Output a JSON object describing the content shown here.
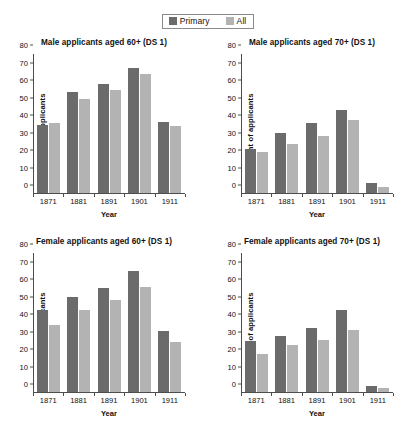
{
  "legend": {
    "items": [
      {
        "label": "Primary",
        "color": "#6b6b6b",
        "icon": "square-swatch-icon"
      },
      {
        "label": "All",
        "color": "#b3b3b3",
        "icon": "square-swatch-icon"
      }
    ]
  },
  "colors": {
    "primary": "#6b6b6b",
    "all": "#b3b3b3",
    "axis": "#4d4d4d",
    "text": "#111111",
    "background": "#ffffff"
  },
  "axis": {
    "yticks": [
      0,
      10,
      20,
      30,
      40,
      50,
      60,
      70,
      80
    ],
    "ylim": [
      0,
      80
    ],
    "ylabel": "Per cent of applicants",
    "xlabel": "Year",
    "categories": [
      "1871",
      "1881",
      "1891",
      "1901",
      "1911"
    ]
  },
  "chart_data": [
    {
      "type": "bar",
      "title": "Male applicants aged 60+ (DS 1)",
      "xlabel": "Year",
      "ylabel": "Per cent of applicants",
      "ylim": [
        0,
        80
      ],
      "yticks": [
        0,
        10,
        20,
        30,
        40,
        50,
        60,
        70,
        80
      ],
      "grid": false,
      "legend_position": "top-center-shared",
      "categories": [
        "1871",
        "1881",
        "1891",
        "1901",
        "1911"
      ],
      "series": [
        {
          "name": "Primary",
          "color": "#6b6b6b",
          "values": [
            39.0,
            58.0,
            62.5,
            71.5,
            40.5
          ]
        },
        {
          "name": "All",
          "color": "#b3b3b3",
          "values": [
            39.8,
            53.8,
            59.0,
            67.8,
            38.5
          ]
        }
      ]
    },
    {
      "type": "bar",
      "title": "Male applicants aged 70+ (DS 1)",
      "xlabel": "Year",
      "ylabel": "Per cent of applicants",
      "ylim": [
        0,
        80
      ],
      "yticks": [
        0,
        10,
        20,
        30,
        40,
        50,
        60,
        70,
        80
      ],
      "grid": false,
      "legend_position": "top-center-shared",
      "categories": [
        "1871",
        "1881",
        "1891",
        "1901",
        "1911"
      ],
      "series": [
        {
          "name": "Primary",
          "color": "#6b6b6b",
          "values": [
            25.0,
            34.5,
            39.8,
            47.5,
            5.5
          ]
        },
        {
          "name": "All",
          "color": "#b3b3b3",
          "values": [
            23.3,
            27.8,
            32.8,
            41.5,
            3.6
          ]
        }
      ]
    },
    {
      "type": "bar",
      "title": "Female applicants aged 60+ (DS 1)",
      "xlabel": "Year",
      "ylabel": "Per cent of applicants",
      "ylim": [
        0,
        80
      ],
      "yticks": [
        0,
        10,
        20,
        30,
        40,
        50,
        60,
        70,
        80
      ],
      "grid": false,
      "legend_position": "top-center-shared",
      "categories": [
        "1871",
        "1881",
        "1891",
        "1901",
        "1911"
      ],
      "series": [
        {
          "name": "Primary",
          "color": "#6b6b6b",
          "values": [
            47.0,
            54.3,
            59.5,
            69.0,
            34.8
          ]
        },
        {
          "name": "All",
          "color": "#b3b3b3",
          "values": [
            38.5,
            47.0,
            52.3,
            60.0,
            28.7
          ]
        }
      ]
    },
    {
      "type": "bar",
      "title": "Female applicants aged 70+ (DS 1)",
      "xlabel": "Year",
      "ylabel": "Per cent of applicants",
      "ylim": [
        0,
        80
      ],
      "yticks": [
        0,
        10,
        20,
        30,
        40,
        50,
        60,
        70,
        80
      ],
      "grid": false,
      "legend_position": "top-center-shared",
      "categories": [
        "1871",
        "1881",
        "1891",
        "1901",
        "1911"
      ],
      "series": [
        {
          "name": "Primary",
          "color": "#6b6b6b",
          "values": [
            29.3,
            32.0,
            36.3,
            46.8,
            3.3
          ]
        },
        {
          "name": "All",
          "color": "#b3b3b3",
          "values": [
            21.8,
            26.6,
            29.5,
            35.5,
            2.2
          ]
        }
      ]
    }
  ]
}
